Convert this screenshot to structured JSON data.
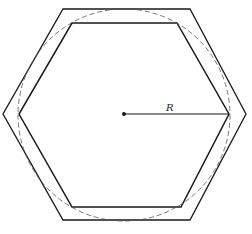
{
  "diagram": {
    "radius_label": "R",
    "colors": {
      "stroke": "#1a1a1a",
      "dashed_circle": "#555555",
      "background": "#fefefe"
    },
    "shapes": {
      "outer_hexagon": "circumscribed hexagon around circle",
      "inner_hexagon": "inscribed hexagon in circle",
      "circle": "dashed circle",
      "center_point": "center dot",
      "radius_line": "line from center to vertex"
    }
  }
}
